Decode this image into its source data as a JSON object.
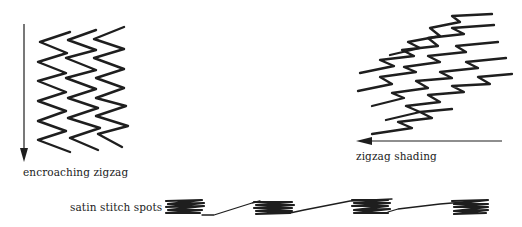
{
  "figure": {
    "panels": [
      {
        "id": "encroaching",
        "label": "encroaching zigzag",
        "arrow_direction": "down"
      },
      {
        "id": "shading",
        "label": "zigzag shading",
        "arrow_direction": "left"
      },
      {
        "id": "satin",
        "label": "satin stitch spots",
        "spot_count": 4
      }
    ]
  },
  "colors": {
    "ink": "#1e1e1e",
    "background": "#ffffff",
    "text": "#222222"
  }
}
